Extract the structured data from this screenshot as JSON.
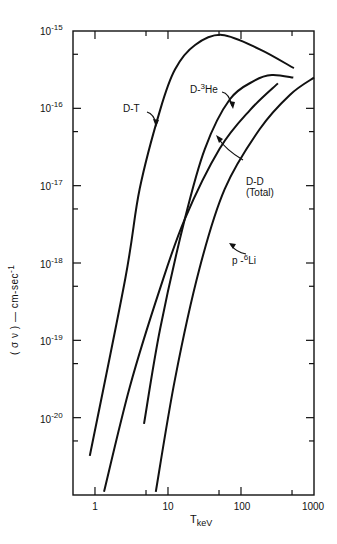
{
  "chart_data": {
    "type": "line",
    "title": "",
    "xlabel": "T_keV",
    "ylabel": "(σ v) — cm-sec^-1",
    "xscale": "log",
    "yscale": "log",
    "xlim": [
      0.5,
      1000
    ],
    "ylim": [
      1e-21,
      1e-15
    ],
    "grid": false,
    "legend": "inline labels with pointer arrows",
    "x_ticks": [
      "1",
      "10",
      "100",
      "1000"
    ],
    "x_minor_ticks": [
      5,
      50,
      500
    ],
    "y_ticks": [
      "10^-15",
      "10^-16",
      "10^-17",
      "10^-18",
      "10^-19",
      "10^-20"
    ],
    "series": [
      {
        "name": "D-T",
        "label_text": "D-T",
        "points": [
          [
            0.85,
            3.2e-21
          ],
          [
            2.6,
            6.3e-19
          ],
          [
            4.1,
            9.1e-18
          ],
          [
            7.8,
            9.5e-17
          ],
          [
            12.5,
            3.2e-16
          ],
          [
            23.5,
            6.6e-16
          ],
          [
            55,
            8.9e-16
          ],
          [
            181,
            5.8e-16
          ],
          [
            530,
            3.3e-16
          ]
        ]
      },
      {
        "name": "D-3He",
        "label_text": "D-",
        "label_sup": "3",
        "label_tail": "He",
        "points": [
          [
            4.7,
            8.3e-21
          ],
          [
            7.8,
            1.4e-19
          ],
          [
            17,
            3.7e-18
          ],
          [
            32,
            3e-17
          ],
          [
            70,
            1.3e-16
          ],
          [
            155,
            2.3e-16
          ],
          [
            265,
            2.7e-16
          ],
          [
            520,
            2.5e-16
          ]
        ]
      },
      {
        "name": "D-D (Total)",
        "label_text": "D-D",
        "label_line2": "(Total)",
        "points": [
          [
            1.33,
            1.1e-21
          ],
          [
            3.0,
            2.5e-20
          ],
          [
            7.8,
            4.7e-19
          ],
          [
            17,
            3.7e-18
          ],
          [
            51,
            3e-17
          ],
          [
            133,
            9.5e-17
          ],
          [
            320,
            2.1e-16
          ]
        ]
      },
      {
        "name": "p-6Li",
        "label_text": "p-",
        "label_sup": "6",
        "label_tail": "Li",
        "points": [
          [
            6.8,
            1.1e-21
          ],
          [
            12.5,
            3.2e-20
          ],
          [
            27,
            8.5e-19
          ],
          [
            60,
            9.1e-18
          ],
          [
            181,
            5.4e-17
          ],
          [
            470,
            1.5e-16
          ],
          [
            1000,
            2.5e-16
          ]
        ]
      }
    ]
  },
  "axes": {
    "x_label_main": "T",
    "x_label_sub": "keV",
    "y_label": "( σ ν ) — cm-sec",
    "y_label_sup": "-1",
    "y_tick_base": "10",
    "y_tick_exps": [
      "-15",
      "-16",
      "-17",
      "-18",
      "-19",
      "-20"
    ],
    "x_tick_labels": [
      "1",
      "10",
      "100",
      "1000"
    ]
  },
  "labels": {
    "dt": "D-T",
    "dhe_prefix": "D-",
    "dhe_sup": "3",
    "dhe_tail": "He",
    "dd_line1": "D-D",
    "dd_line2": "(Total)",
    "pli_prefix": "p -",
    "pli_sup": "6",
    "pli_tail": "Li"
  },
  "style": {
    "line_color": "#111111",
    "background": "#ffffff"
  }
}
